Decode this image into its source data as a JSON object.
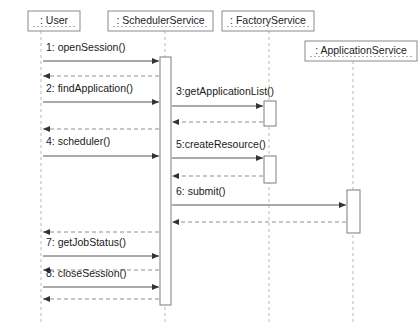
{
  "diagram": {
    "type": "uml-sequence-diagram",
    "title": "",
    "background_color": "#ffffff",
    "line_color": "#555555",
    "return_line_color": "#8d8d8d",
    "lifeline_color": "#b9b9b9",
    "box_border_color": "#8a8a8a",
    "text_color": "#1a1a1a"
  },
  "participants": [
    {
      "id": "user",
      "label": ": User",
      "box": {
        "x": 28,
        "y": 11,
        "width": 52,
        "height": 20
      },
      "lifeline_x": 41,
      "lifeline_top": 31,
      "lifeline_bottom": 325
    },
    {
      "id": "scheduler_service",
      "label": ": SchedulerService",
      "box": {
        "x": 108,
        "y": 11,
        "width": 105,
        "height": 20
      },
      "lifeline_x": 165,
      "lifeline_top": 31,
      "lifeline_bottom": 325
    },
    {
      "id": "factory_service",
      "label": ": FactoryService",
      "box": {
        "x": 222,
        "y": 11,
        "width": 92,
        "height": 20
      },
      "lifeline_x": 269,
      "lifeline_top": 31,
      "lifeline_bottom": 325
    },
    {
      "id": "application_service",
      "label": ": ApplicationService",
      "box": {
        "x": 305,
        "y": 41,
        "width": 112,
        "height": 20
      },
      "lifeline_x": 353,
      "lifeline_top": 61,
      "lifeline_bottom": 325
    }
  ],
  "activations": [
    {
      "id": "act-scheduler-main",
      "participant": "scheduler_service",
      "x": 160,
      "y": 57,
      "width": 11,
      "height": 248
    },
    {
      "id": "act-factory-1",
      "participant": "factory_service",
      "x": 264,
      "y": 101,
      "width": 12,
      "height": 25
    },
    {
      "id": "act-factory-2",
      "participant": "factory_service",
      "x": 264,
      "y": 156,
      "width": 12,
      "height": 27
    },
    {
      "id": "act-application-1",
      "participant": "application_service",
      "x": 347,
      "y": 190,
      "width": 13,
      "height": 43
    }
  ],
  "messages": [
    {
      "seq": "1",
      "label": "1: openSession()",
      "from": "user",
      "to": "scheduler_service",
      "kind": "call",
      "x1": 43,
      "x2": 159,
      "y": 61,
      "label_x": 46,
      "label_y": 48
    },
    {
      "seq": "1r",
      "label": "",
      "from": "scheduler_service",
      "to": "user",
      "kind": "return",
      "x1": 159,
      "x2": 43,
      "y": 76,
      "label_x": 0,
      "label_y": 0
    },
    {
      "seq": "2",
      "label": "2: findApplication()",
      "from": "user",
      "to": "scheduler_service",
      "kind": "call",
      "x1": 43,
      "x2": 159,
      "y": 102,
      "label_x": 46,
      "label_y": 89
    },
    {
      "seq": "3",
      "label": "3:getApplicationList()",
      "from": "scheduler_service",
      "to": "factory_service",
      "kind": "call",
      "x1": 172,
      "x2": 263,
      "y": 106,
      "label_x": 176,
      "label_y": 92
    },
    {
      "seq": "3r",
      "label": "",
      "from": "factory_service",
      "to": "scheduler_service",
      "kind": "return",
      "x1": 263,
      "x2": 172,
      "y": 122,
      "label_x": 0,
      "label_y": 0
    },
    {
      "seq": "2r",
      "label": "",
      "from": "scheduler_service",
      "to": "user",
      "kind": "return",
      "x1": 159,
      "x2": 43,
      "y": 129,
      "label_x": 0,
      "label_y": 0
    },
    {
      "seq": "4",
      "label": "4: scheduler()",
      "from": "user",
      "to": "scheduler_service",
      "kind": "call",
      "x1": 43,
      "x2": 159,
      "y": 156,
      "label_x": 46,
      "label_y": 142
    },
    {
      "seq": "5",
      "label": "5:createResource()",
      "from": "scheduler_service",
      "to": "factory_service",
      "kind": "call",
      "x1": 172,
      "x2": 263,
      "y": 158,
      "label_x": 176,
      "label_y": 145
    },
    {
      "seq": "5r",
      "label": "",
      "from": "factory_service",
      "to": "scheduler_service",
      "kind": "return",
      "x1": 263,
      "x2": 172,
      "y": 176,
      "label_x": 0,
      "label_y": 0
    },
    {
      "seq": "6",
      "label": "6: submit()",
      "from": "scheduler_service",
      "to": "application_service",
      "kind": "call",
      "x1": 172,
      "x2": 346,
      "y": 205,
      "label_x": 176,
      "label_y": 192
    },
    {
      "seq": "6r",
      "label": "",
      "from": "application_service",
      "to": "scheduler_service",
      "kind": "return",
      "x1": 346,
      "x2": 172,
      "y": 222,
      "label_x": 0,
      "label_y": 0
    },
    {
      "seq": "4r",
      "label": "",
      "from": "scheduler_service",
      "to": "user",
      "kind": "return",
      "x1": 159,
      "x2": 43,
      "y": 232,
      "label_x": 0,
      "label_y": 0
    },
    {
      "seq": "7",
      "label": "7: getJobStatus()",
      "from": "user",
      "to": "scheduler_service",
      "kind": "call",
      "x1": 43,
      "x2": 159,
      "y": 256,
      "label_x": 46,
      "label_y": 243
    },
    {
      "seq": "7r",
      "label": "",
      "from": "scheduler_service",
      "to": "user",
      "kind": "return",
      "x1": 159,
      "x2": 43,
      "y": 270,
      "label_x": 0,
      "label_y": 0
    },
    {
      "seq": "8",
      "label": "8: closeSession()",
      "from": "user",
      "to": "scheduler_service",
      "kind": "call",
      "x1": 43,
      "x2": 159,
      "y": 287,
      "label_x": 46,
      "label_y": 274
    },
    {
      "seq": "8r",
      "label": "",
      "from": "scheduler_service",
      "to": "user",
      "kind": "return",
      "x1": 159,
      "x2": 43,
      "y": 299,
      "label_x": 0,
      "label_y": 0
    }
  ]
}
